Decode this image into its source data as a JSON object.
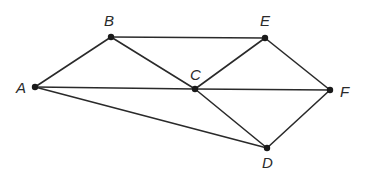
{
  "diagram": {
    "type": "graph",
    "nodes": [
      {
        "id": "A",
        "label": "A",
        "x": 35,
        "y": 87,
        "lx": 16,
        "ly": 93
      },
      {
        "id": "B",
        "label": "B",
        "x": 111,
        "y": 37,
        "lx": 104,
        "ly": 26
      },
      {
        "id": "C",
        "label": "C",
        "x": 195,
        "y": 89,
        "lx": 190,
        "ly": 80
      },
      {
        "id": "E",
        "label": "E",
        "x": 265,
        "y": 38,
        "lx": 260,
        "ly": 26
      },
      {
        "id": "F",
        "label": "F",
        "x": 330,
        "y": 90,
        "lx": 340,
        "ly": 97
      },
      {
        "id": "D",
        "label": "D",
        "x": 267,
        "y": 148,
        "lx": 262,
        "ly": 168
      }
    ],
    "edges": [
      {
        "from": "A",
        "to": "B"
      },
      {
        "from": "A",
        "to": "C"
      },
      {
        "from": "A",
        "to": "D"
      },
      {
        "from": "B",
        "to": "E"
      },
      {
        "from": "B",
        "to": "C"
      },
      {
        "from": "C",
        "to": "E"
      },
      {
        "from": "C",
        "to": "F"
      },
      {
        "from": "C",
        "to": "D"
      },
      {
        "from": "E",
        "to": "F"
      },
      {
        "from": "D",
        "to": "F"
      }
    ]
  }
}
